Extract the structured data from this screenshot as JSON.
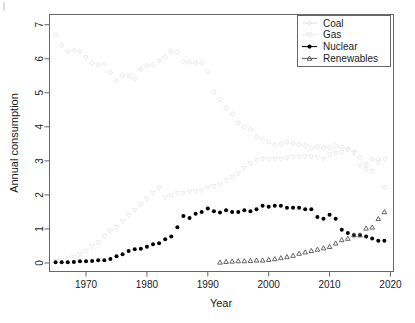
{
  "chart_data": {
    "type": "scatter",
    "title": "",
    "xlabel": "Year",
    "ylabel": "Annual consumption",
    "xlim": [
      1964,
      2020.5
    ],
    "ylim": [
      -0.25,
      7.3
    ],
    "xticks": [
      1970,
      1980,
      1990,
      2000,
      2010,
      2020
    ],
    "yticks": [
      0,
      1,
      2,
      3,
      4,
      5,
      6,
      7
    ],
    "grid": false,
    "legend_position": "top-right",
    "series": [
      {
        "name": "Coal",
        "marker": "diamond-open",
        "color": "#e2e2e2",
        "x": [
          1965,
          1966,
          1967,
          1968,
          1969,
          1970,
          1971,
          1972,
          1973,
          1974,
          1975,
          1976,
          1977,
          1978,
          1979,
          1980,
          1981,
          1982,
          1983,
          1984,
          1985,
          1986,
          1987,
          1988,
          1989,
          1990,
          1991,
          1992,
          1993,
          1994,
          1995,
          1996,
          1997,
          1998,
          1999,
          2000,
          2001,
          2002,
          2003,
          2004,
          2005,
          2006,
          2007,
          2008,
          2009,
          2010,
          2011,
          2012,
          2013,
          2014,
          2015,
          2016,
          2017,
          2018,
          2019
        ],
        "y": [
          6.7,
          6.4,
          6.22,
          6.25,
          6.22,
          6.05,
          5.88,
          5.82,
          5.84,
          5.6,
          5.35,
          5.52,
          5.5,
          5.42,
          5.7,
          5.8,
          5.82,
          5.95,
          6.05,
          6.22,
          6.2,
          5.92,
          5.9,
          5.88,
          5.88,
          5.62,
          5.02,
          4.8,
          4.55,
          4.38,
          4.12,
          4.0,
          3.92,
          3.7,
          3.62,
          3.55,
          3.48,
          3.5,
          3.55,
          3.52,
          3.48,
          3.45,
          3.38,
          3.42,
          3.38,
          3.4,
          3.45,
          3.4,
          3.35,
          3.28,
          3.1,
          2.9,
          3.05,
          3.05,
          2.22
        ]
      },
      {
        "name": "Gas",
        "marker": "triangle-down-open",
        "color": "#e9e9e9",
        "x": [
          1965,
          1966,
          1967,
          1968,
          1969,
          1970,
          1971,
          1972,
          1973,
          1974,
          1975,
          1976,
          1977,
          1978,
          1979,
          1980,
          1981,
          1982,
          1983,
          1984,
          1985,
          1986,
          1987,
          1988,
          1989,
          1990,
          1991,
          1992,
          1993,
          1994,
          1995,
          1996,
          1997,
          1998,
          1999,
          2000,
          2001,
          2002,
          2003,
          2004,
          2005,
          2006,
          2007,
          2008,
          2009,
          2010,
          2011,
          2012,
          2013,
          2014,
          2015,
          2016,
          2017,
          2018,
          2019
        ],
        "y": [
          0.05,
          0.08,
          0.12,
          0.18,
          0.25,
          0.35,
          0.48,
          0.6,
          0.78,
          0.92,
          1.05,
          1.22,
          1.4,
          1.55,
          1.72,
          1.88,
          2.05,
          2.2,
          1.92,
          1.98,
          2.05,
          2.05,
          2.08,
          2.1,
          2.12,
          2.22,
          2.25,
          2.3,
          2.42,
          2.52,
          2.62,
          2.78,
          2.92,
          3.02,
          3.05,
          3.05,
          3.05,
          3.05,
          3.08,
          3.12,
          3.12,
          3.12,
          3.12,
          3.1,
          3.05,
          3.18,
          3.22,
          3.25,
          3.32,
          3.22,
          2.85,
          2.75,
          2.7,
          2.95,
          3.05
        ]
      },
      {
        "name": "Nuclear",
        "marker": "circle-filled",
        "color": "#000000",
        "x": [
          1965,
          1966,
          1967,
          1968,
          1969,
          1970,
          1971,
          1972,
          1973,
          1974,
          1975,
          1976,
          1977,
          1978,
          1979,
          1980,
          1981,
          1982,
          1983,
          1984,
          1985,
          1986,
          1987,
          1988,
          1989,
          1990,
          1991,
          1992,
          1993,
          1994,
          1995,
          1996,
          1997,
          1998,
          1999,
          2000,
          2001,
          2002,
          2003,
          2004,
          2005,
          2006,
          2007,
          2008,
          2009,
          2010,
          2011,
          2012,
          2013,
          2014,
          2015,
          2016,
          2017,
          2018,
          2019
        ],
        "y": [
          0.02,
          0.02,
          0.02,
          0.03,
          0.05,
          0.05,
          0.06,
          0.08,
          0.08,
          0.12,
          0.2,
          0.26,
          0.35,
          0.4,
          0.42,
          0.48,
          0.55,
          0.58,
          0.7,
          0.78,
          1.05,
          1.38,
          1.32,
          1.45,
          1.5,
          1.6,
          1.52,
          1.48,
          1.55,
          1.5,
          1.5,
          1.55,
          1.52,
          1.58,
          1.68,
          1.65,
          1.68,
          1.68,
          1.62,
          1.62,
          1.62,
          1.58,
          1.58,
          1.35,
          1.3,
          1.42,
          1.3,
          0.98,
          0.88,
          0.82,
          0.82,
          0.78,
          0.72,
          0.65,
          0.65
        ]
      },
      {
        "name": "Renewables",
        "marker": "triangle-up-open",
        "color": "#555555",
        "x": [
          1992,
          1993,
          1994,
          1995,
          1996,
          1997,
          1998,
          1999,
          2000,
          2001,
          2002,
          2003,
          2004,
          2005,
          2006,
          2007,
          2008,
          2009,
          2010,
          2011,
          2012,
          2013,
          2014,
          2015,
          2016,
          2017,
          2018,
          2019
        ],
        "y": [
          0.02,
          0.04,
          0.05,
          0.06,
          0.06,
          0.07,
          0.08,
          0.08,
          0.1,
          0.12,
          0.15,
          0.18,
          0.22,
          0.28,
          0.32,
          0.36,
          0.4,
          0.44,
          0.48,
          0.58,
          0.68,
          0.72,
          0.82,
          0.82,
          1.02,
          1.05,
          1.3,
          1.5
        ]
      }
    ]
  },
  "legend": {
    "entries": [
      {
        "label": "Coal"
      },
      {
        "label": "Gas"
      },
      {
        "label": "Nuclear"
      },
      {
        "label": "Renewables"
      }
    ]
  },
  "axes": {
    "x_title": "Year",
    "y_title": "Annual consumption",
    "x_tick_labels": [
      "1970",
      "1980",
      "1990",
      "2000",
      "2010",
      "2020"
    ],
    "y_tick_labels": [
      "0",
      "1",
      "2",
      "3",
      "4",
      "5",
      "6",
      "7"
    ]
  },
  "colors": {
    "coal": "#e2e2e2",
    "gas": "#e9e9e9",
    "nuclear": "#000000",
    "renewables": "#555555",
    "frame": "#666666",
    "text": "#1a1a1a"
  }
}
